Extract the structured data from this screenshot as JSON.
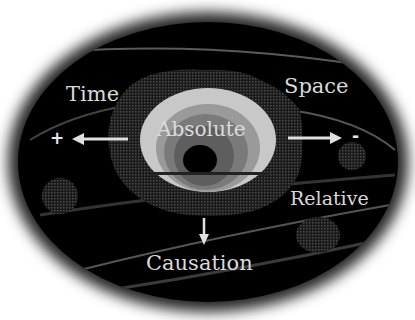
{
  "diagram": {
    "labels": {
      "time": "Time",
      "space": "Space",
      "absolute": "Absolute",
      "relative": "Relative",
      "causation": "Causation"
    },
    "signs": {
      "plus": "+",
      "minus": "-"
    },
    "arrows": [
      {
        "name": "time-arrow",
        "direction": "left"
      },
      {
        "name": "space-arrow",
        "direction": "right"
      },
      {
        "name": "causation-arrow",
        "direction": "down"
      }
    ],
    "colors": {
      "background": "#ffffff",
      "field": "#000000",
      "text": "#d9d9d9",
      "rings": [
        "#3a3a3a",
        "#c8c8c8",
        "#9a9a9a",
        "#7a7a7a",
        "#5e5e5e",
        "#000000"
      ]
    }
  }
}
